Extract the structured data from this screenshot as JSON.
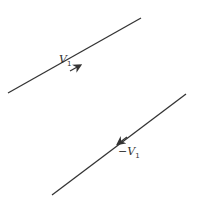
{
  "diagram": {
    "type": "vector-diagram",
    "stroke_color": "#333333",
    "vectors": [
      {
        "name": "V1",
        "label_main": "V",
        "label_sub": "1",
        "prefix": "",
        "direction": "up-right",
        "line": {
          "x1": 8,
          "y1": 93,
          "x2": 141,
          "y2": 18
        },
        "arrow_at": {
          "x": 79,
          "y": 66
        }
      },
      {
        "name": "-V1",
        "label_main": "V",
        "label_sub": "1",
        "prefix": "−",
        "direction": "down-left",
        "line": {
          "x1": 52,
          "y1": 195,
          "x2": 186,
          "y2": 94
        },
        "arrow_at": {
          "x": 119,
          "y": 143
        }
      }
    ]
  }
}
